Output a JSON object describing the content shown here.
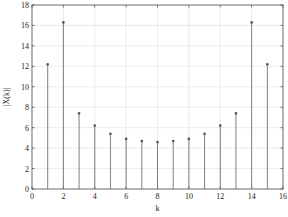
{
  "chart_data": {
    "type": "stem",
    "title": "",
    "xlabel": "k",
    "ylabel": "|X(k)|",
    "xlim": [
      0,
      16
    ],
    "ylim": [
      0,
      18
    ],
    "xticks": [
      0,
      2,
      4,
      6,
      8,
      10,
      12,
      14,
      16
    ],
    "yticks": [
      0,
      2,
      4,
      6,
      8,
      10,
      12,
      14,
      16,
      18
    ],
    "grid": true,
    "legend": null,
    "x": [
      1,
      2,
      3,
      4,
      5,
      6,
      7,
      8,
      9,
      10,
      11,
      12,
      13,
      14,
      15
    ],
    "values": [
      12.2,
      16.3,
      7.4,
      6.2,
      5.4,
      4.9,
      4.7,
      4.6,
      4.7,
      4.9,
      5.4,
      6.2,
      7.4,
      16.3,
      12.2
    ],
    "colors": {
      "stem": "#707070",
      "marker": "#555555",
      "grid": "#e2e2e2",
      "axis": "#444444"
    }
  }
}
